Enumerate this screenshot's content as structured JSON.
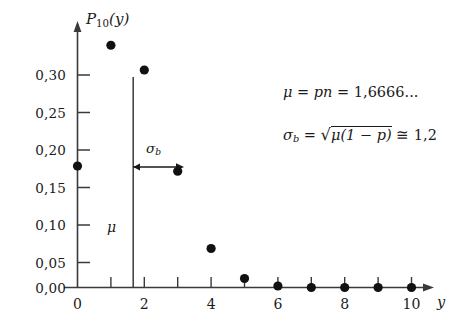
{
  "chart_data": {
    "type": "scatter",
    "title": "",
    "xlabel": "y",
    "ylabel": "P_10(y)",
    "x": [
      0,
      1,
      2,
      3,
      4,
      5,
      6,
      7,
      8,
      9,
      10
    ],
    "values": [
      0.162,
      0.323,
      0.29,
      0.155,
      0.052,
      0.012,
      0.002,
      0.0,
      0.0,
      0.0,
      0.0
    ],
    "xlim": [
      0,
      10
    ],
    "ylim": [
      0.0,
      0.345
    ],
    "xticks": [
      0,
      1,
      2,
      3,
      4,
      5,
      6,
      7,
      8,
      9,
      10
    ],
    "xtick_labels": [
      "0",
      "",
      "2",
      "",
      "4",
      "",
      "6",
      "",
      "8",
      "",
      "10"
    ],
    "yticks": [
      0.0,
      0.05,
      0.1,
      0.15,
      0.2,
      0.25,
      0.3
    ],
    "ytick_labels": [
      "0,00",
      "0,05",
      "0,10",
      "0,15",
      "0,20",
      "0,25",
      "0,30"
    ],
    "grid": false,
    "legend": null,
    "marker": "filled-circle",
    "marker_color": "#111111",
    "annotations": [
      {
        "name": "mu-vertical-line",
        "type": "vline",
        "x": 1.6666,
        "y_top": 0.322,
        "label": "μ"
      },
      {
        "name": "sigma-arrow",
        "type": "arrow",
        "x_start": 1.6666,
        "x_end": 2.8666,
        "y": 0.175,
        "label": "σ_b"
      },
      {
        "name": "mu-formula",
        "type": "text",
        "text": "μ = pn = 1,6666..."
      },
      {
        "name": "sigma-formula",
        "type": "text",
        "text": "σ_b = √(μ(1-p)) ≅ 1,2"
      }
    ]
  },
  "axes": {
    "y_title": {
      "symbol": "P",
      "subscript": "10",
      "argument": "(y)"
    },
    "x_title": "y",
    "ytick_labels": [
      "0,30",
      "0,25",
      "0,20",
      "0,15",
      "0,10",
      "0,05",
      "0,00"
    ],
    "xtick_labels": [
      "0",
      "2",
      "4",
      "6",
      "8",
      "10"
    ]
  },
  "annotations": {
    "mu_line_label": "μ",
    "sigma_arrow_label": {
      "symbol": "σ",
      "subscript": "b"
    },
    "formula_mu": {
      "mu": "μ",
      "eq1": "=",
      "pn": "pn",
      "eq2": "=",
      "value": "1,6666",
      "ellipsis": "..."
    },
    "formula_sigma": {
      "sigma": "σ",
      "subscript": "b",
      "eq": "=",
      "radical": "√",
      "radicand": "μ(1 − p)",
      "approx": "≅",
      "value": "1,2"
    }
  },
  "colors": {
    "axis": "#3a3a3a",
    "marker": "#111111",
    "text": "#1a1a1a"
  }
}
